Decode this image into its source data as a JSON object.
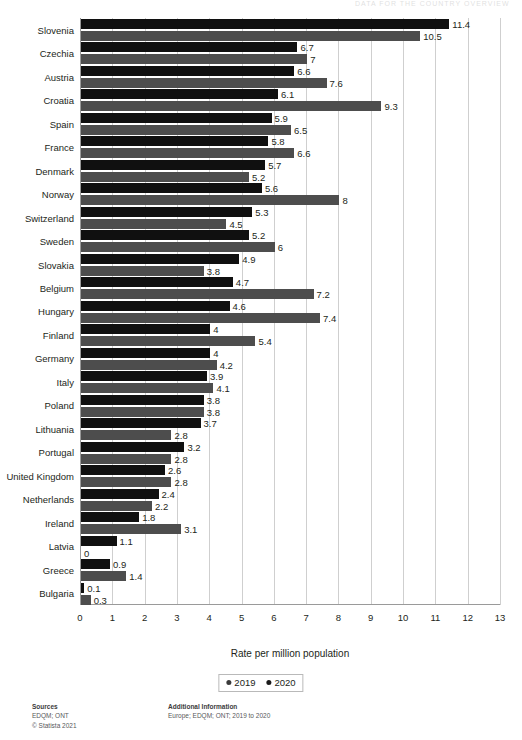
{
  "header": {
    "remnant_text": "DATA FOR THE COUNTRY OVERVIEW"
  },
  "chart_data": {
    "type": "bar",
    "orientation": "horizontal",
    "title": "",
    "subtitle": "",
    "xlabel": "Rate per million population",
    "ylabel": "",
    "xlim": [
      0,
      13
    ],
    "xticks": [
      0,
      1,
      2,
      3,
      4,
      5,
      6,
      7,
      8,
      9,
      10,
      11,
      12,
      13
    ],
    "grid": true,
    "legend_position": "bottom",
    "categories": [
      "Slovenia",
      "Czechia",
      "Austria",
      "Croatia",
      "Spain",
      "France",
      "Denmark",
      "Norway",
      "Switzerland",
      "Sweden",
      "Slovakia",
      "Belgium",
      "Hungary",
      "Finland",
      "Germany",
      "Italy",
      "Poland",
      "Lithuania",
      "Portugal",
      "United Kingdom",
      "Netherlands",
      "Ireland",
      "Latvia",
      "Greece",
      "Bulgaria"
    ],
    "series": [
      {
        "name": "2019",
        "color": "#101010",
        "values": [
          11.4,
          6.7,
          6.6,
          6.1,
          5.9,
          5.8,
          5.7,
          5.6,
          5.3,
          5.2,
          4.9,
          4.7,
          4.6,
          4,
          4,
          3.9,
          3.8,
          3.7,
          3.2,
          2.6,
          2.4,
          1.8,
          1.1,
          0.9,
          0.1
        ],
        "labels": [
          "11.4",
          "6.7",
          "6.6",
          "6.1",
          "5.9",
          "5.8",
          "5.7",
          "5.6",
          "5.3",
          "5.2",
          "4.9",
          "4.7",
          "4.6",
          "4",
          "4",
          "3.9",
          "3.8",
          "3.7",
          "3.2",
          "2.6",
          "2.4",
          "1.8",
          "1.1",
          "0.9",
          "0.1"
        ]
      },
      {
        "name": "2020",
        "color": "#4d4d4d",
        "values": [
          10.5,
          7,
          7.6,
          9.3,
          6.5,
          6.6,
          5.2,
          8,
          4.5,
          6,
          3.8,
          7.2,
          7.4,
          5.4,
          4.2,
          4.1,
          3.8,
          2.8,
          2.8,
          2.8,
          2.2,
          3.1,
          0,
          1.4,
          0.3
        ],
        "labels": [
          "10.5",
          "7",
          "7.6",
          "9.3",
          "6.5",
          "6.6",
          "5.2",
          "8",
          "4.5",
          "6",
          "3.8",
          "7.2",
          "7.4",
          "5.4",
          "4.2",
          "4.1",
          "3.8",
          "2.8",
          "2.8",
          "2.8",
          "2.2",
          "3.1",
          "0",
          "1.4",
          "0.3"
        ]
      }
    ]
  },
  "legend": {
    "items": [
      {
        "label": "2019",
        "color": "#3a3a3a"
      },
      {
        "label": "2020",
        "color": "#1a1a1a"
      }
    ]
  },
  "footer": {
    "sources_title": "Sources",
    "sources_line1": "EDQM; ONT",
    "sources_line2": "© Statista 2021",
    "additional_title": "Additional Information",
    "additional_line1": "Europe; EDQM; ONT; 2019 to 2020"
  }
}
